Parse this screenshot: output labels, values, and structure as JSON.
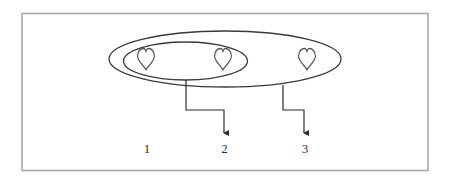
{
  "diagram": {
    "type": "set-nesting",
    "colors": {
      "frame": "#a8a8a8",
      "stroke": "#3a3a3a",
      "heart": "#555555",
      "text": "#333333"
    },
    "items": [
      {
        "icon": "heart-outline-icon"
      },
      {
        "icon": "heart-outline-icon"
      },
      {
        "icon": "heart-outline-icon"
      }
    ],
    "groups": [
      {
        "name": "inner-set",
        "contains_items": [
          1,
          2
        ],
        "points_to": "2"
      },
      {
        "name": "outer-set",
        "contains_items": [
          1,
          2,
          3
        ],
        "points_to": "3"
      }
    ],
    "labels": [
      "1",
      "2",
      "3"
    ]
  }
}
